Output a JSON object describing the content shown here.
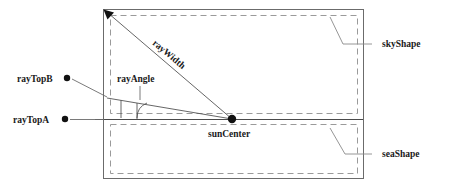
{
  "diagram": {
    "labels": {
      "ray_top_b": "rayTopB",
      "ray_top_a": "rayTopA",
      "ray_angle": "rayAngle",
      "ray_width": "rayWidth",
      "sun_center": "sunCenter",
      "sky_shape": "skyShape",
      "sea_shape": "seaShape"
    },
    "colors": {
      "background": "#ffffff",
      "frame_stroke": "#6b6b6b",
      "dashed_stroke": "#9a9a9a",
      "ray_stroke": "#555555",
      "marker_fill": "#111111",
      "text_fill": "#1a1a1a"
    },
    "geometry": {
      "frame": {
        "x": 103,
        "y": 9,
        "width": 261,
        "height": 170
      },
      "sky_region": {
        "x": 110,
        "y": 15,
        "width": 248,
        "height": 99
      },
      "sea_region": {
        "x": 110,
        "y": 124,
        "width": 248,
        "height": 50
      },
      "horizon_y": 119,
      "sun_center": {
        "x": 232,
        "y": 119
      },
      "ray_apex": {
        "x": 105,
        "y": 11
      },
      "ray_angle_degrees": 5
    }
  }
}
